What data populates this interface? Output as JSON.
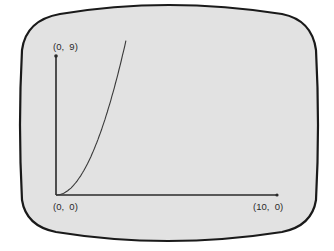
{
  "screen": {
    "background": "#e2e2e2",
    "border_color": "#1a1a1a",
    "page_background": "#ffffff"
  },
  "labels": {
    "y_max": "(0,  9)",
    "origin": "(0,  0)",
    "x_max": "(10,  0)"
  },
  "chart_data": {
    "type": "line",
    "title": "",
    "xlabel": "",
    "ylabel": "",
    "xlim": [
      0,
      10
    ],
    "ylim": [
      0,
      9
    ],
    "grid": false,
    "legend": null,
    "annotations": [
      "(0, 9)",
      "(0, 0)",
      "(10, 0)"
    ],
    "series": [
      {
        "name": "y = x^2",
        "x": [
          0,
          0.5,
          1,
          1.5,
          2,
          2.5,
          3,
          3.15
        ],
        "y": [
          0,
          0.25,
          1,
          2.25,
          4,
          6.25,
          9,
          9.9
        ]
      }
    ],
    "line_color": "#3a3a3a",
    "axis_color": "#2a2a2a"
  }
}
